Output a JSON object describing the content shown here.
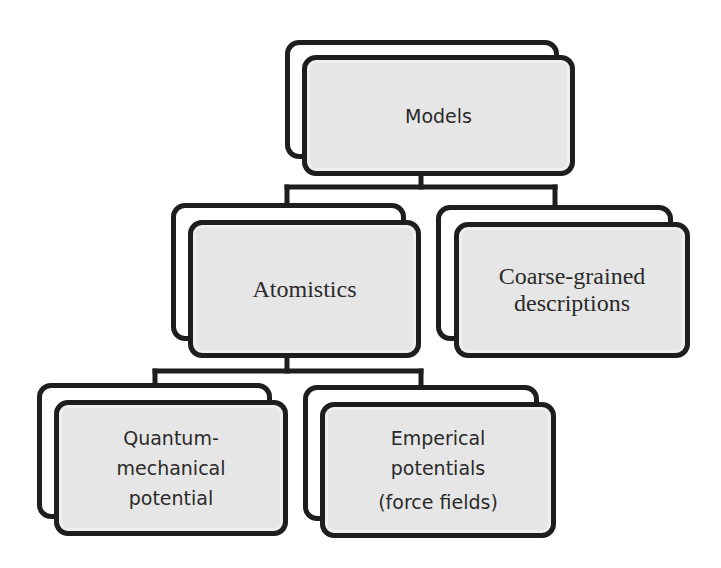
{
  "diagram": {
    "type": "hierarchy-tree",
    "root": {
      "id": "models",
      "label_lines": [
        "Models"
      ],
      "children": [
        "atomistics",
        "coarse-grained"
      ]
    },
    "nodes": {
      "models": {
        "label_lines": [
          "Models"
        ]
      },
      "atomistics": {
        "label_lines": [
          "Atomistics"
        ]
      },
      "coarse_grained": {
        "label_lines": [
          "Coarse-grained",
          "descriptions"
        ]
      },
      "quantum": {
        "label_lines": [
          "Quantum-",
          "mechanical",
          "potential"
        ]
      },
      "emperical": {
        "label_lines": [
          "Emperical",
          "potentials",
          "(force fields)"
        ]
      }
    },
    "edges": [
      {
        "from": "Models",
        "to": "Atomistics"
      },
      {
        "from": "Models",
        "to": "Coarse-grained descriptions"
      },
      {
        "from": "Atomistics",
        "to": "Quantum-mechanical potential"
      },
      {
        "from": "Atomistics",
        "to": "Emperical potentials (force fields)"
      }
    ],
    "colors": {
      "border": "#1e1e1e",
      "fill": "#e6e6e6",
      "text": "#2a2a2a",
      "background": "#ffffff"
    }
  }
}
